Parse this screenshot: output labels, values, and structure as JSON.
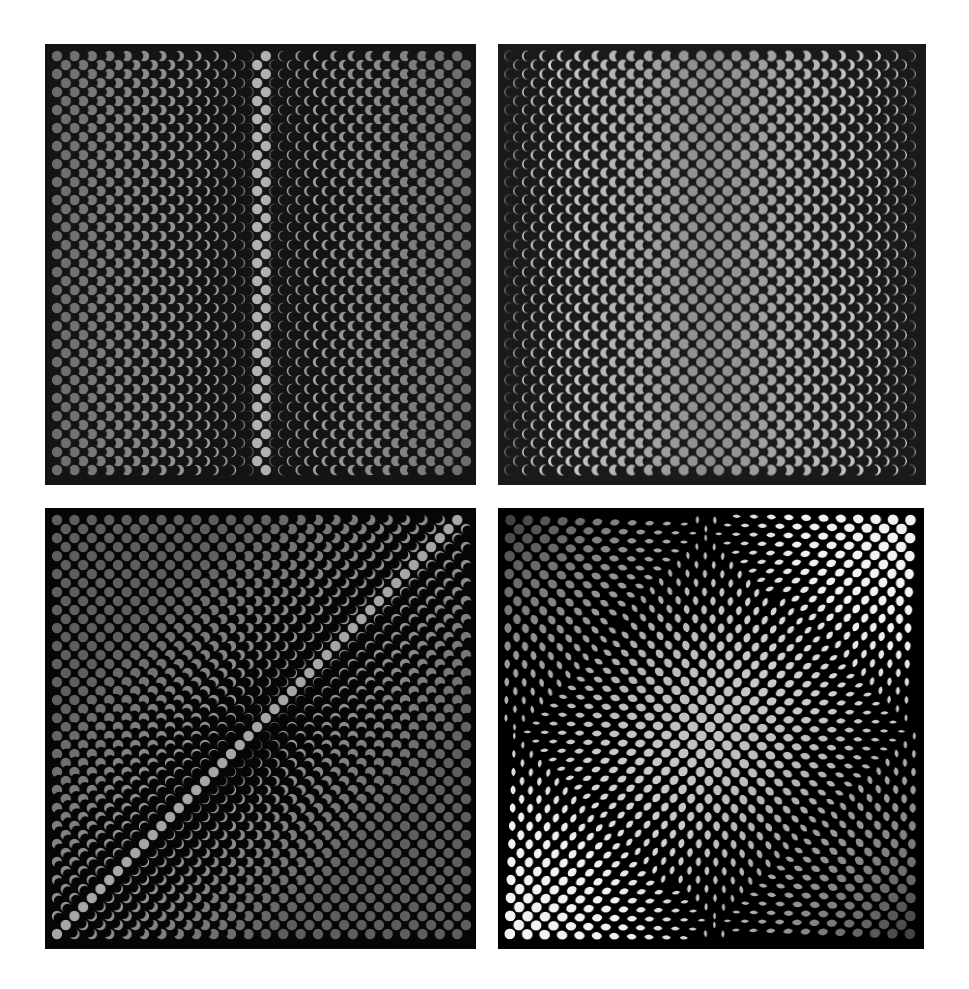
{
  "figure": {
    "background": "#ffffff",
    "width": 969,
    "height": 989
  },
  "panels": [
    {
      "id": "top-left",
      "rect": {
        "x": 45,
        "y": 44,
        "w": 431,
        "h": 441
      },
      "background": "#141414",
      "dot_color": "#b4b4b4",
      "pitch_x": 17.4,
      "pitch_y": 9.0,
      "radius": 5.2,
      "mode": "mask-center",
      "description": "Staggered grid of gray dots; full discs in the central column, crescents thinning toward left and right edges"
    },
    {
      "id": "top-right",
      "rect": {
        "x": 498,
        "y": 44,
        "w": 428,
        "h": 441
      },
      "background": "#1a1a1a",
      "dot_color": "#ececec",
      "pitch_x": 17.4,
      "pitch_y": 9.0,
      "radius": 5.4,
      "mode": "mask-edges",
      "description": "Staggered grid of white dots; full discs at left/right edges, crescents thinning toward central dark column"
    },
    {
      "id": "bottom-left",
      "rect": {
        "x": 45,
        "y": 508,
        "w": 431,
        "h": 441
      },
      "background": "#060606",
      "dot_color": "#a8a8a8",
      "pitch_x": 17.4,
      "pitch_y": 9.0,
      "radius": 5.2,
      "mode": "mask-rotate",
      "description": "Staggered grid of gray dots; full discs along the bottom-left and top-right, rotating crescents forming a dark diagonal band"
    },
    {
      "id": "bottom-right",
      "rect": {
        "x": 498,
        "y": 508,
        "w": 426,
        "h": 441
      },
      "background": "#000000",
      "dot_color": "#f2f2f2",
      "pitch_x": 17.4,
      "pitch_y": 9.0,
      "radius": 5.6,
      "mode": "intersect-rotate",
      "description": "Moiré of two rotated dot grids; bowtie/pinched intersections, bright at top-right and bottom-left, dark at top-left and bottom-right"
    }
  ]
}
